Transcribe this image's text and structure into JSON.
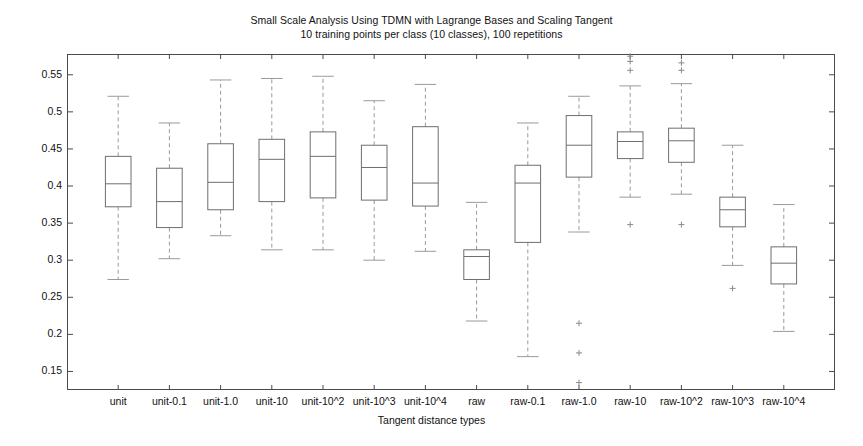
{
  "chart_data": {
    "type": "box",
    "title": "Small Scale Analysis Using TDMN with Lagrange Bases and Scaling Tangent",
    "subtitle": "10 training points per class (10 classes), 100 repetitions",
    "xlabel": "Tangent distance types",
    "ylabel": "Average Recognition Rate",
    "ylim": [
      0.125,
      0.578
    ],
    "ytick_labels": [
      "0.55",
      "0.5",
      "0.45",
      "0.4",
      "0.35",
      "0.3",
      "0.25",
      "0.2",
      "0.15"
    ],
    "ytick_values": [
      0.55,
      0.5,
      0.45,
      0.4,
      0.35,
      0.3,
      0.25,
      0.2,
      0.15
    ],
    "grid": false,
    "legend": "none",
    "categories": [
      "unit",
      "unit-0.1",
      "unit-1.0",
      "unit-10",
      "unit-10^2",
      "unit-10^3",
      "unit-10^4",
      "raw",
      "raw-0.1",
      "raw-1.0",
      "raw-10",
      "raw-10^2",
      "raw-10^3",
      "raw-10^4"
    ],
    "boxes": [
      {
        "label": "unit",
        "whisker_low": 0.274,
        "q1": 0.372,
        "median": 0.403,
        "q3": 0.44,
        "whisker_high": 0.521,
        "outliers": []
      },
      {
        "label": "unit-0.1",
        "whisker_low": 0.302,
        "q1": 0.344,
        "median": 0.379,
        "q3": 0.424,
        "whisker_high": 0.485,
        "outliers": []
      },
      {
        "label": "unit-1.0",
        "whisker_low": 0.333,
        "q1": 0.368,
        "median": 0.405,
        "q3": 0.457,
        "whisker_high": 0.543,
        "outliers": []
      },
      {
        "label": "unit-10",
        "whisker_low": 0.314,
        "q1": 0.379,
        "median": 0.436,
        "q3": 0.463,
        "whisker_high": 0.545,
        "outliers": []
      },
      {
        "label": "unit-10^2",
        "whisker_low": 0.314,
        "q1": 0.384,
        "median": 0.44,
        "q3": 0.473,
        "whisker_high": 0.548,
        "outliers": []
      },
      {
        "label": "unit-10^3",
        "whisker_low": 0.3,
        "q1": 0.381,
        "median": 0.425,
        "q3": 0.455,
        "whisker_high": 0.515,
        "outliers": []
      },
      {
        "label": "unit-10^4",
        "whisker_low": 0.312,
        "q1": 0.373,
        "median": 0.404,
        "q3": 0.48,
        "whisker_high": 0.537,
        "outliers": []
      },
      {
        "label": "raw",
        "whisker_low": 0.218,
        "q1": 0.274,
        "median": 0.305,
        "q3": 0.314,
        "whisker_high": 0.378,
        "outliers": []
      },
      {
        "label": "raw-0.1",
        "whisker_low": 0.17,
        "q1": 0.324,
        "median": 0.404,
        "q3": 0.428,
        "whisker_high": 0.485,
        "outliers": []
      },
      {
        "label": "raw-1.0",
        "whisker_low": 0.338,
        "q1": 0.412,
        "median": 0.455,
        "q3": 0.495,
        "whisker_high": 0.521,
        "outliers": [
          0.215,
          0.175,
          0.135
        ]
      },
      {
        "label": "raw-10",
        "whisker_low": 0.385,
        "q1": 0.437,
        "median": 0.46,
        "q3": 0.473,
        "whisker_high": 0.535,
        "outliers": [
          0.575,
          0.568,
          0.556,
          0.348
        ]
      },
      {
        "label": "raw-10^2",
        "whisker_low": 0.389,
        "q1": 0.432,
        "median": 0.461,
        "q3": 0.478,
        "whisker_high": 0.538,
        "outliers": [
          0.566,
          0.556,
          0.348
        ]
      },
      {
        "label": "raw-10^3",
        "whisker_low": 0.293,
        "q1": 0.345,
        "median": 0.368,
        "q3": 0.385,
        "whisker_high": 0.455,
        "outliers": [
          0.262
        ]
      },
      {
        "label": "raw-10^4",
        "whisker_low": 0.204,
        "q1": 0.268,
        "median": 0.296,
        "q3": 0.318,
        "whisker_high": 0.375,
        "outliers": []
      }
    ],
    "colors": {
      "box_edge": "#6e6e6e",
      "median": "#6e6e6e",
      "whisker": "#9a9a9a",
      "outlier": "#8a8a8a",
      "frame": "#4a4a4a",
      "text": "#111111",
      "background": "#ffffff"
    }
  }
}
